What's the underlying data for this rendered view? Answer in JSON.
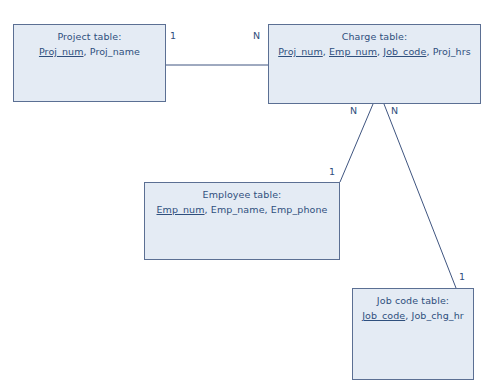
{
  "diagram": {
    "type": "entity-relationship-table-diagram",
    "colors": {
      "box_fill": "#e4ebf4",
      "box_border": "#5b6f93",
      "text": "#2f4f7d",
      "line": "#3f5580",
      "background": "#ffffff"
    },
    "entities": [
      {
        "id": "project",
        "title": "Project table:",
        "attributes": [
          {
            "name": "Proj_num",
            "primary_key": true
          },
          {
            "name": "Proj_name",
            "primary_key": false
          }
        ],
        "attributes_text": "Proj_num, Proj_name",
        "x": 13,
        "y": 24,
        "width": 153,
        "height": 78
      },
      {
        "id": "charge",
        "title": "Charge table:",
        "attributes": [
          {
            "name": "Proj_num",
            "primary_key": true
          },
          {
            "name": "Emp_num",
            "primary_key": true
          },
          {
            "name": "Job_code",
            "primary_key": true
          },
          {
            "name": "Proj_hrs",
            "primary_key": false
          }
        ],
        "attributes_text": "Proj_num, Emp_num, Job_code, Proj_hrs",
        "x": 268,
        "y": 24,
        "width": 213,
        "height": 80
      },
      {
        "id": "employee",
        "title": "Employee table:",
        "attributes": [
          {
            "name": "Emp_num",
            "primary_key": true
          },
          {
            "name": "Emp_name",
            "primary_key": false
          },
          {
            "name": "Emp_phone",
            "primary_key": false
          }
        ],
        "attributes_text": "Emp_num, Emp_name, Emp_phone",
        "x": 144,
        "y": 182,
        "width": 196,
        "height": 78
      },
      {
        "id": "jobcode",
        "title": "Job code table:",
        "attributes": [
          {
            "name": "Job_code",
            "primary_key": true
          },
          {
            "name": "Job_chg_hr",
            "primary_key": false
          }
        ],
        "attributes_text": "Job_code, Job_chg_hr",
        "x": 352,
        "y": 288,
        "width": 122,
        "height": 92
      }
    ],
    "relationships": [
      {
        "id": "project-charge",
        "from": "project",
        "to": "charge",
        "from_cardinality": "1",
        "to_cardinality": "N"
      },
      {
        "id": "employee-charge",
        "from": "employee",
        "to": "charge",
        "from_cardinality": "1",
        "to_cardinality": "N"
      },
      {
        "id": "jobcode-charge",
        "from": "jobcode",
        "to": "charge",
        "from_cardinality": "1",
        "to_cardinality": "N"
      }
    ],
    "cardinality_labels": [
      {
        "id": "project-side-one",
        "text": "1",
        "x": 170,
        "y": 31
      },
      {
        "id": "charge-side-n-project",
        "text": "N",
        "x": 253,
        "y": 31
      },
      {
        "id": "charge-side-n-employee",
        "text": "N",
        "x": 350,
        "y": 106
      },
      {
        "id": "charge-side-n-jobcode",
        "text": "N",
        "x": 391,
        "y": 106
      },
      {
        "id": "employee-side-one",
        "text": "1",
        "x": 329,
        "y": 167
      },
      {
        "id": "jobcode-side-one",
        "text": "1",
        "x": 459,
        "y": 272
      }
    ]
  }
}
